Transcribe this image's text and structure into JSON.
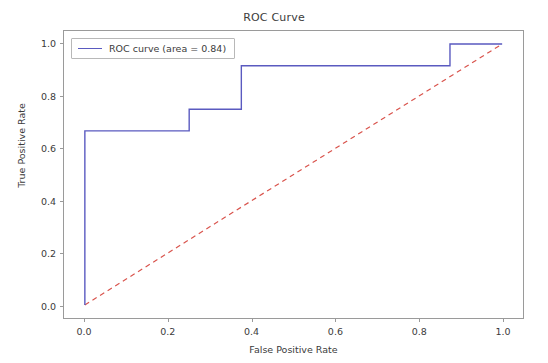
{
  "chart_data": {
    "type": "line",
    "title": "ROC Curve",
    "xlabel": "False Positive Rate",
    "ylabel": "True Positive Rate",
    "xlim": [
      -0.05,
      1.05
    ],
    "ylim": [
      -0.05,
      1.05
    ],
    "grid": false,
    "legend_position": "upper left",
    "xticks": [
      "0.0",
      "0.2",
      "0.4",
      "0.6",
      "0.8",
      "1.0"
    ],
    "xtick_values": [
      0.0,
      0.2,
      0.4,
      0.6,
      0.8,
      1.0
    ],
    "yticks": [
      "0.0",
      "0.2",
      "0.4",
      "0.6",
      "0.8",
      "1.0"
    ],
    "ytick_values": [
      0.0,
      0.2,
      0.4,
      0.6,
      0.8,
      1.0
    ],
    "auc": 0.84,
    "series": [
      {
        "name": "ROC curve (area = 0.84)",
        "style": "solid",
        "color": "#5a5ac0",
        "drawstyle": "steps-post",
        "x": [
          0.0,
          0.0,
          0.25,
          0.25,
          0.375,
          0.375,
          0.875,
          0.875,
          1.0
        ],
        "y": [
          0.0,
          0.667,
          0.667,
          0.75,
          0.75,
          0.917,
          0.917,
          1.0,
          1.0
        ]
      },
      {
        "name": "chance-diagonal",
        "style": "dashed",
        "color": "#d9544d",
        "x": [
          0.0,
          1.0
        ],
        "y": [
          0.0,
          1.0
        ]
      }
    ]
  },
  "legend": {
    "entries": [
      {
        "label": "ROC curve (area = 0.84)",
        "color": "#5a5ac0"
      }
    ]
  },
  "colors": {
    "roc_line": "#5a5ac0",
    "diagonal_line": "#d9544d",
    "axis": "#9a9a9a",
    "text": "#3b3b3b",
    "background": "#ffffff"
  }
}
